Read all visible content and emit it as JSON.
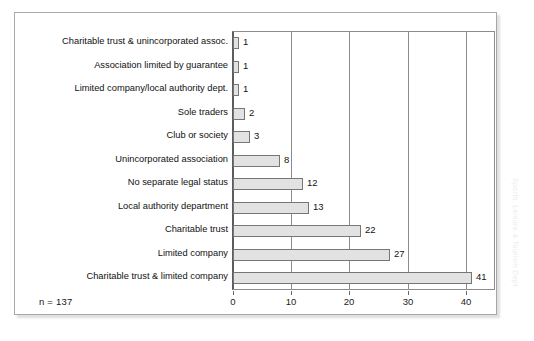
{
  "figure": {
    "sample_size_label": "n = 137",
    "source_credit": "Sports, Leisure & Tourism Dept"
  },
  "chart_data": {
    "type": "bar",
    "orientation": "horizontal",
    "title": "",
    "subtitle": "",
    "xlabel": "",
    "ylabel": "",
    "xlim": [
      0,
      45
    ],
    "grid": true,
    "gridlines_at": [
      0,
      10,
      20,
      30,
      40
    ],
    "legend": "none",
    "bar_fill_color": "#e2e2e2",
    "bar_border_color": "#767676",
    "axis_color": "#8c8c8c",
    "tick_labels": [
      "0",
      "10",
      "20",
      "30",
      "40"
    ],
    "tick_values": [
      0,
      10,
      20,
      30,
      40
    ],
    "categories": [
      "Charitable trust & unincorporated assoc.",
      "Association limited by guarantee",
      "Limited company/local authority dept.",
      "Sole traders",
      "Club or society",
      "Unincorporated association",
      "No separate legal status",
      "Local authority department",
      "Charitable trust",
      "Limited company",
      "Charitable trust & limited company"
    ],
    "values": [
      1,
      1,
      1,
      2,
      3,
      8,
      12,
      13,
      22,
      27,
      41
    ],
    "data_labels": [
      "1",
      "1",
      "1",
      "2",
      "3",
      "8",
      "12",
      "13",
      "22",
      "27",
      "41"
    ],
    "total": 137
  }
}
